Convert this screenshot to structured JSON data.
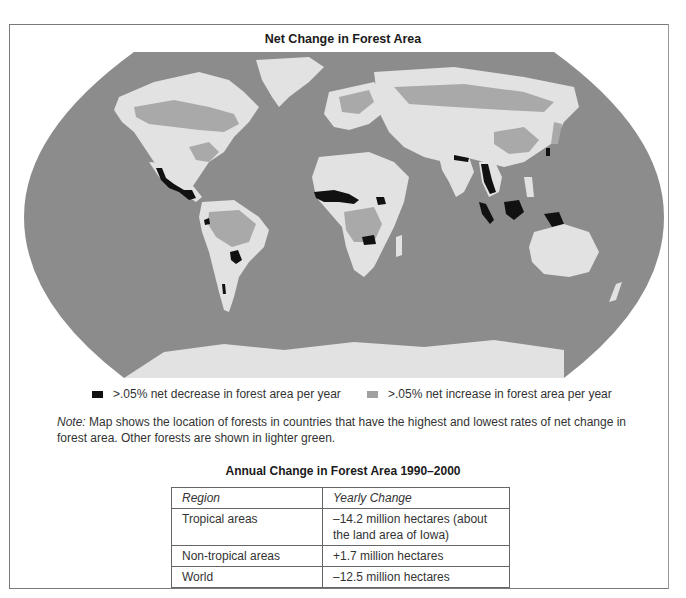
{
  "title": "Net Change in Forest Area",
  "colors": {
    "ocean": "#8c8c8c",
    "land_other": "#e2e2e2",
    "increase": "#a9a9a9",
    "decrease": "#111111",
    "frame": "#7a7a7a"
  },
  "legend": [
    {
      "label": ">.05% net decrease in forest area per year",
      "swatch": "#111111"
    },
    {
      "label": ">.05% net increase in forest area per year",
      "swatch": "#a0a0a0"
    }
  ],
  "note": {
    "prefix": "Note:",
    "text": " Map shows the location of forests in countries that have the highest and lowest rates of net change in forest area. Other forests are shown in lighter green."
  },
  "table": {
    "title": "Annual Change in Forest Area 1990–2000",
    "headers": [
      "Region",
      "Yearly Change"
    ],
    "rows": [
      [
        "Tropical areas",
        "–14.2 million hectares (about the land area of Iowa)"
      ],
      [
        "Non-tropical areas",
        "+1.7 million hectares"
      ],
      [
        "World",
        "–12.5 million hectares"
      ]
    ]
  },
  "map_regions": {
    "decrease": [
      "Mexico",
      "Central America",
      "West Africa",
      "Central/East Africa",
      "Zimbabwe/Zambia",
      "Argentina/Paraguay",
      "Chile",
      "Myanmar",
      "Nepal",
      "Indonesia",
      "Borneo",
      "New Guinea",
      "Philippines",
      "Korea"
    ],
    "increase": [
      "Canada boreal",
      "Eastern USA",
      "Brazil/Amazon",
      "Europe",
      "Russia/Siberia",
      "Congo Basin",
      "China",
      "Japan"
    ]
  }
}
